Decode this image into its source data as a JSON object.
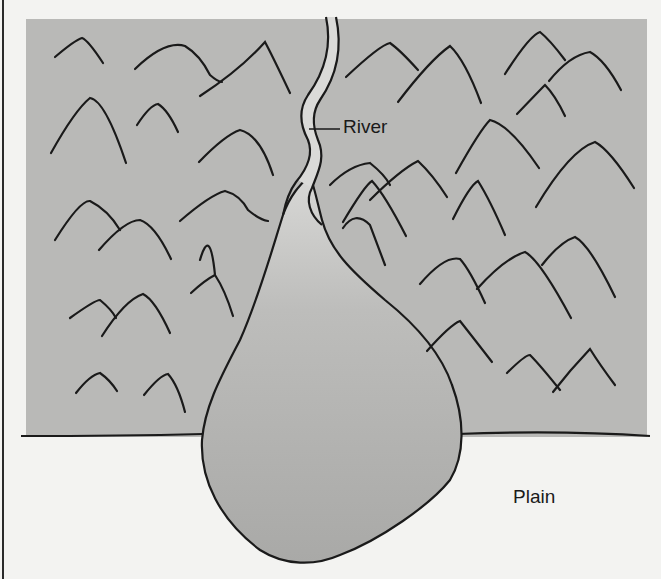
{
  "diagram": {
    "type": "alluvial fan landform illustration",
    "labels": {
      "river": "River",
      "plain": "Plain"
    },
    "colors": {
      "mountain_area": "#b9b9b7",
      "fan": "#acacaa",
      "fan_apex_highlight": "#d6d6d4",
      "river_channel": "#dadad8",
      "plain": "#f3f3f1",
      "lines": "#1a1a1a"
    },
    "regions": [
      {
        "name": "mountains",
        "description": "gray rectangular upland area with mountain symbols"
      },
      {
        "name": "river",
        "description": "narrow winding channel from top edge down to fan apex"
      },
      {
        "name": "alluvial-fan",
        "description": "teardrop-shaped deposit spreading onto the plain"
      },
      {
        "name": "plain",
        "description": "white lowland below the mountain front"
      }
    ]
  }
}
